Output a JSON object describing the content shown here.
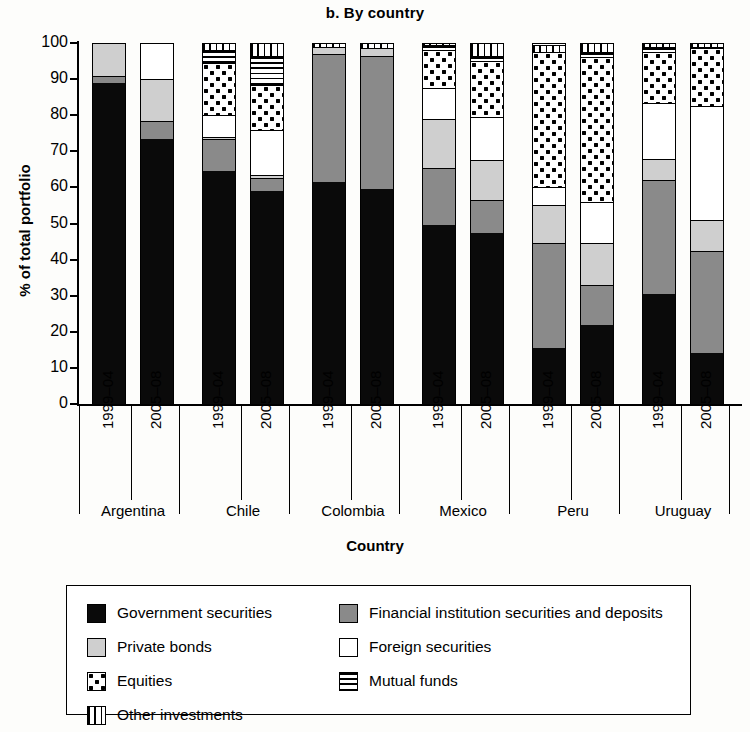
{
  "chart_data": {
    "type": "bar",
    "subtype": "stacked-bar-100pct",
    "title": "b. By country",
    "xlabel": "Country",
    "ylabel": "% of total portfolio",
    "ylim": [
      0,
      100
    ],
    "yticks": [
      0,
      10,
      20,
      30,
      40,
      50,
      60,
      70,
      80,
      90,
      100
    ],
    "grid": false,
    "legend_position": "bottom",
    "categories": [
      "Argentina 1999–04",
      "Argentina 2005–08",
      "Chile 1999–04",
      "Chile 2005–08",
      "Colombia 1999–04",
      "Colombia 2005–08",
      "Mexico 1999–04",
      "Mexico 2005–08",
      "Peru 1999–04",
      "Peru 2005–08",
      "Uruguay 1999–04",
      "Uruguay 2005–08"
    ],
    "countries": [
      "Argentina",
      "Chile",
      "Colombia",
      "Mexico",
      "Peru",
      "Uruguay"
    ],
    "periods": [
      "1999–04",
      "2005–08"
    ],
    "series": [
      {
        "name": "Government securities",
        "key": "gov",
        "fill": "solid-black",
        "color": "#0a0a0a",
        "values": [
          89,
          73.5,
          64.5,
          59,
          61.5,
          59.5,
          49.5,
          47.5,
          15.5,
          22,
          30.5,
          14
        ]
      },
      {
        "name": "Financial institution securities and deposits",
        "key": "fin",
        "fill": "solid-gray",
        "color": "#8a8a8a",
        "values": [
          2,
          5,
          9,
          3.5,
          35.5,
          37,
          16,
          9,
          29,
          11,
          31.5,
          28.5
        ]
      },
      {
        "name": "Private bonds",
        "key": "priv",
        "fill": "light-gray",
        "color": "#cfcfcf",
        "values": [
          9,
          11.5,
          0.5,
          1,
          2,
          2,
          13.5,
          11,
          10.5,
          11.5,
          6,
          8.5
        ]
      },
      {
        "name": "Foreign securities",
        "key": "for",
        "fill": "white",
        "color": "#ffffff",
        "values": [
          0,
          10,
          6,
          12.5,
          0,
          0,
          8.5,
          12,
          5,
          11.5,
          15.5,
          31.5
        ]
      },
      {
        "name": "Equities",
        "key": "eq",
        "fill": "checkered-dots",
        "color": "#ffffff",
        "values": [
          0,
          0,
          14.5,
          12.5,
          0,
          0,
          10.5,
          15.5,
          37.5,
          40,
          14,
          16
        ]
      },
      {
        "name": "Mutual funds",
        "key": "mut",
        "fill": "horizontal-lines",
        "color": "#ffffff",
        "values": [
          0,
          0,
          3.5,
          8,
          0,
          0,
          1.5,
          1.5,
          0,
          1.5,
          1.5,
          0.5
        ]
      },
      {
        "name": "Other investments",
        "key": "oth",
        "fill": "vertical-lines",
        "color": "#ffffff",
        "values": [
          0,
          0,
          2,
          3.5,
          1,
          1.5,
          0.5,
          3.5,
          2,
          2.5,
          1,
          1
        ]
      }
    ]
  },
  "legend": {
    "items": [
      {
        "label": "Government securities",
        "key": "gov"
      },
      {
        "label": "Financial institution securities and deposits",
        "key": "fin"
      },
      {
        "label": "Private bonds",
        "key": "priv"
      },
      {
        "label": "Foreign securities",
        "key": "for"
      },
      {
        "label": "Equities",
        "key": "eq"
      },
      {
        "label": "Mutual funds",
        "key": "mut"
      },
      {
        "label": "Other investments",
        "key": "oth"
      }
    ]
  }
}
